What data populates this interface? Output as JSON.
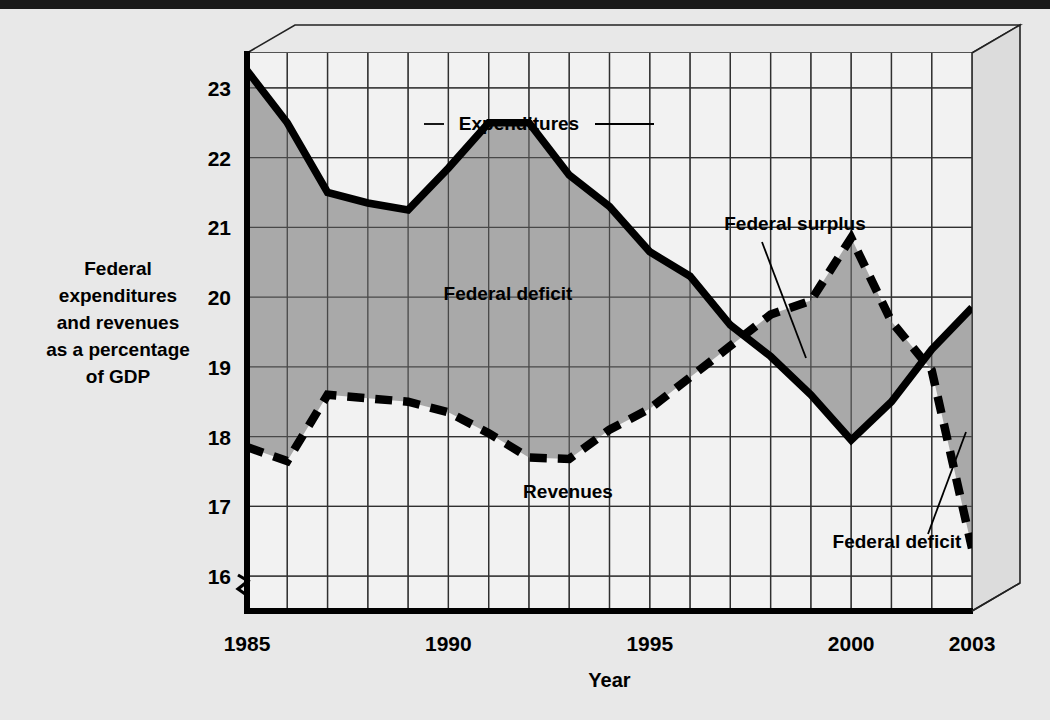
{
  "figure": {
    "background_color": "#e8e8e8",
    "plot_background_color": "#f2f2f2",
    "fill_color": "#a9a9a9",
    "line_color": "#000000",
    "grid_color": "#3a3a3a",
    "axis_break_symbol": "zigzag"
  },
  "axis_label_lines": [
    "Federal",
    "expenditures",
    "and revenues",
    "as a percentage",
    "of GDP"
  ],
  "annotations": {
    "expenditures": "Expenditures",
    "revenues": "Revenues",
    "federal_deficit_left": "Federal deficit",
    "federal_surplus": "Federal surplus",
    "federal_deficit_right": "Federal deficit"
  },
  "chart_data": {
    "type": "line",
    "title": "",
    "subtitle": "",
    "xlabel": "Year",
    "ylabel": "Federal expenditures and revenues as a percentage of GDP",
    "xlim": [
      1985,
      2003
    ],
    "ylim": [
      15.5,
      23.5
    ],
    "yticks": [
      16,
      17,
      18,
      19,
      20,
      21,
      22,
      23
    ],
    "xticks": [
      1985,
      1990,
      1995,
      2000,
      2003
    ],
    "xtick_labels": [
      "1985",
      "1990",
      "1995",
      "2000",
      "2003"
    ],
    "grid": true,
    "grid_x_step": 1,
    "grid_y_step": 1,
    "legend": "inline-annotations",
    "x": [
      1985,
      1986,
      1987,
      1988,
      1989,
      1990,
      1991,
      1992,
      1993,
      1994,
      1995,
      1996,
      1997,
      1998,
      1999,
      2000,
      2001,
      2002,
      2003
    ],
    "series": [
      {
        "name": "Expenditures",
        "style": "solid",
        "values": [
          23.25,
          22.5,
          21.5,
          21.35,
          21.25,
          21.85,
          22.5,
          22.5,
          21.75,
          21.3,
          20.65,
          20.3,
          19.6,
          19.15,
          18.6,
          17.95,
          18.5,
          19.25,
          19.85
        ]
      },
      {
        "name": "Revenues",
        "style": "dashed",
        "values": [
          17.85,
          17.65,
          18.6,
          18.55,
          18.5,
          18.35,
          18.05,
          17.7,
          17.68,
          18.1,
          18.4,
          18.85,
          19.3,
          19.75,
          19.95,
          20.85,
          19.65,
          18.95,
          16.4
        ]
      }
    ],
    "shaded_regions": [
      {
        "name": "Federal deficit",
        "from": 1985,
        "to": 1998,
        "between": [
          "Expenditures",
          "Revenues"
        ]
      },
      {
        "name": "Federal surplus",
        "from": 1998,
        "to": 2002,
        "between": [
          "Revenues",
          "Expenditures"
        ]
      },
      {
        "name": "Federal deficit",
        "from": 2002,
        "to": 2003,
        "between": [
          "Expenditures",
          "Revenues"
        ]
      }
    ]
  }
}
